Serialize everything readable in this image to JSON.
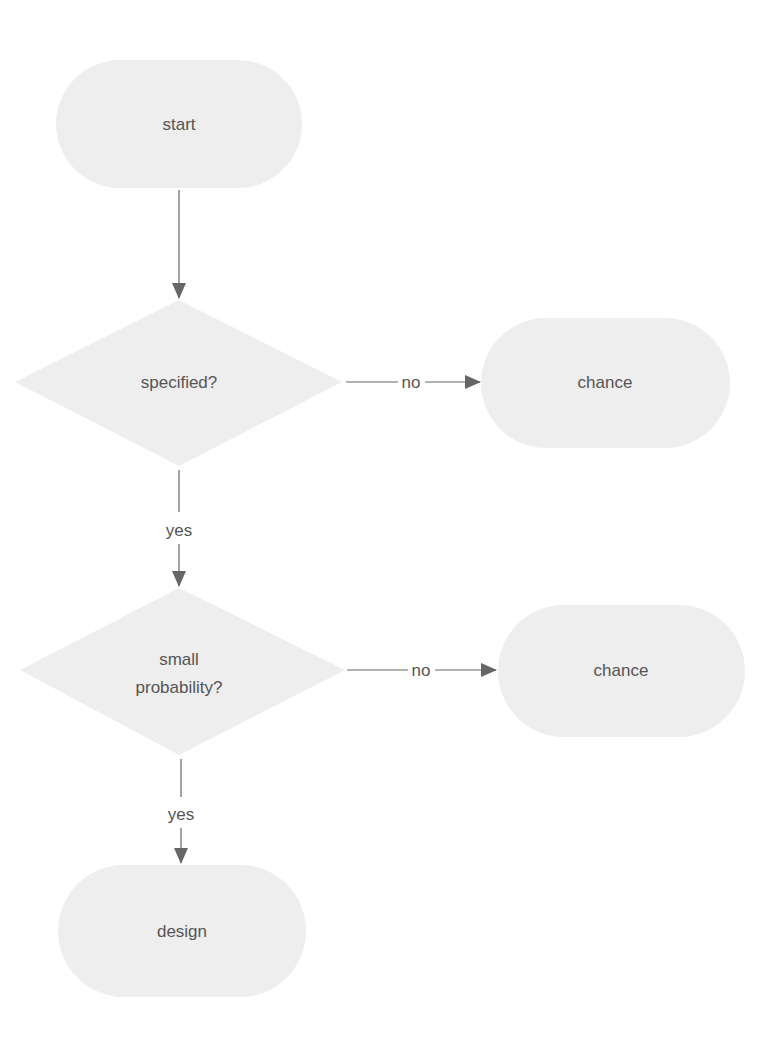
{
  "diagram": {
    "type": "flowchart",
    "colors": {
      "node_fill": "#eeeeee",
      "edge": "#666666",
      "text": "#555555",
      "background": "#ffffff"
    },
    "nodes": {
      "start": {
        "label": "start",
        "shape": "terminal"
      },
      "specified": {
        "label": "specified?",
        "shape": "decision"
      },
      "chance1": {
        "label": "chance",
        "shape": "terminal"
      },
      "small_probability": {
        "label_line1": "small",
        "label_line2": "probability?",
        "shape": "decision"
      },
      "chance2": {
        "label": "chance",
        "shape": "terminal"
      },
      "design": {
        "label": "design",
        "shape": "terminal"
      }
    },
    "edges": {
      "start_to_specified": {
        "label": ""
      },
      "specified_no": {
        "label": "no"
      },
      "specified_yes": {
        "label": "yes"
      },
      "small_probability_no": {
        "label": "no"
      },
      "small_probability_yes": {
        "label": "yes"
      }
    }
  }
}
